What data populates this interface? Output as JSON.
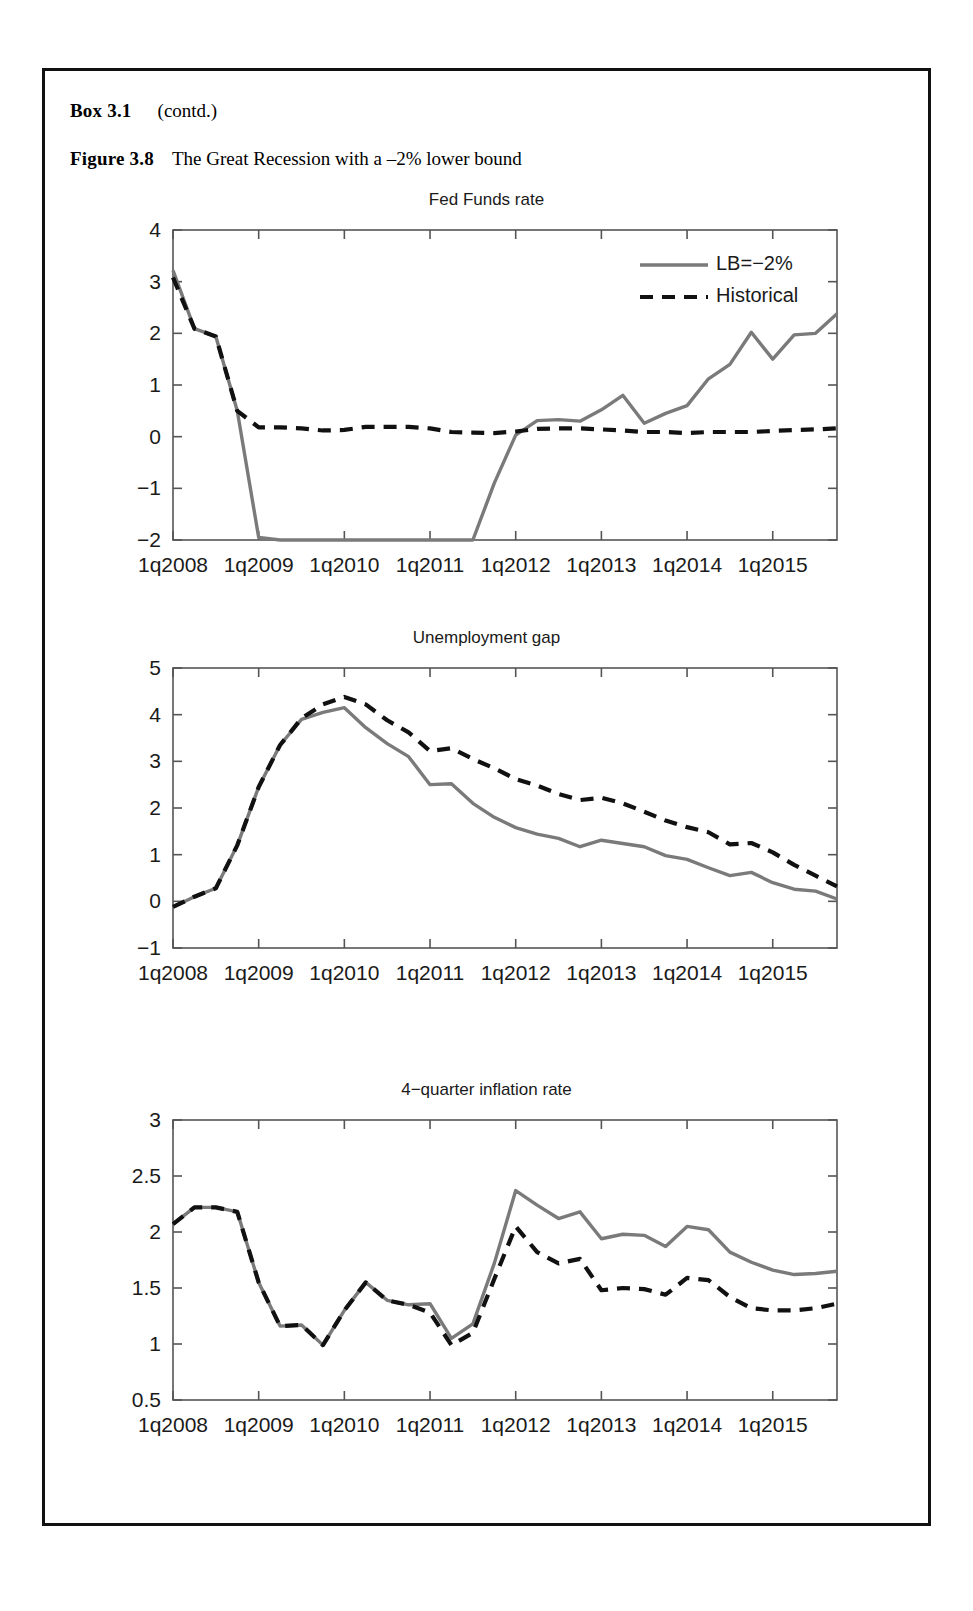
{
  "box": {
    "label": "Box 3.1",
    "contd": "(contd.)"
  },
  "figure": {
    "label": "Figure 3.8",
    "caption": "The Great Recession with a –2% lower bound"
  },
  "legend": {
    "series_solid": "LB=−2%",
    "series_dashed": "Historical",
    "position": "top-right-panel-1"
  },
  "colors": {
    "solid_line": "#7a7a7a",
    "dashed_line": "#111111",
    "axis": "#555555",
    "frame": "#111111",
    "text": "#1a1a1a"
  },
  "x_tick_labels": [
    "1q2008",
    "1q2009",
    "1q2010",
    "1q2011",
    "1q2012",
    "1q2013",
    "1q2014",
    "1q2015"
  ],
  "chart_data": [
    {
      "type": "line",
      "title": "Fed Funds rate",
      "xlabel": "",
      "ylabel": "",
      "xlim": [
        2008.0,
        2015.75
      ],
      "ylim": [
        -2,
        4
      ],
      "yticks": [
        -2,
        -1,
        0,
        1,
        2,
        3,
        4
      ],
      "ytick_labels": [
        "−2",
        "−1",
        "0",
        "1",
        "2",
        "3",
        "4"
      ],
      "xticks": [
        2008.0,
        2009.0,
        2010.0,
        2011.0,
        2012.0,
        2013.0,
        2014.0,
        2015.0
      ],
      "xtick_labels": [
        "1q2008",
        "1q2009",
        "1q2010",
        "1q2011",
        "1q2012",
        "1q2013",
        "1q2014",
        "1q2015"
      ],
      "grid": false,
      "legend": [
        "LB=−2%",
        "Historical"
      ],
      "x": [
        2008.0,
        2008.25,
        2008.5,
        2008.75,
        2009.0,
        2009.25,
        2009.5,
        2009.75,
        2010.0,
        2010.25,
        2010.5,
        2010.75,
        2011.0,
        2011.25,
        2011.5,
        2011.75,
        2012.0,
        2012.25,
        2012.5,
        2012.75,
        2013.0,
        2013.25,
        2013.5,
        2013.75,
        2014.0,
        2014.25,
        2014.5,
        2014.75,
        2015.0,
        2015.25,
        2015.5,
        2015.75
      ],
      "series": [
        {
          "name": "LB=−2%",
          "style": "solid",
          "color": "#7a7a7a",
          "values": [
            3.22,
            2.09,
            1.94,
            0.5,
            -1.95,
            -2.0,
            -2.0,
            -2.0,
            -2.0,
            -2.0,
            -2.0,
            -2.0,
            -2.0,
            -2.0,
            -2.0,
            -0.9,
            0.03,
            0.31,
            0.33,
            0.3,
            0.52,
            0.8,
            0.26,
            0.45,
            0.6,
            1.12,
            1.4,
            2.02,
            1.5,
            1.97,
            2.0,
            2.38
          ]
        },
        {
          "name": "Historical",
          "style": "dashed",
          "color": "#111111",
          "values": [
            3.08,
            2.09,
            1.94,
            0.5,
            0.18,
            0.18,
            0.16,
            0.12,
            0.13,
            0.19,
            0.19,
            0.19,
            0.16,
            0.09,
            0.08,
            0.07,
            0.1,
            0.15,
            0.16,
            0.16,
            0.14,
            0.12,
            0.09,
            0.09,
            0.07,
            0.09,
            0.09,
            0.09,
            0.11,
            0.13,
            0.14,
            0.16
          ]
        }
      ]
    },
    {
      "type": "line",
      "title": "Unemployment gap",
      "xlabel": "",
      "ylabel": "",
      "xlim": [
        2008.0,
        2015.75
      ],
      "ylim": [
        -1,
        5
      ],
      "yticks": [
        -1,
        0,
        1,
        2,
        3,
        4,
        5
      ],
      "ytick_labels": [
        "−1",
        "0",
        "1",
        "2",
        "3",
        "4",
        "5"
      ],
      "xticks": [
        2008.0,
        2009.0,
        2010.0,
        2011.0,
        2012.0,
        2013.0,
        2014.0,
        2015.0
      ],
      "xtick_labels": [
        "1q2008",
        "1q2009",
        "1q2010",
        "1q2011",
        "1q2012",
        "1q2013",
        "1q2014",
        "1q2015"
      ],
      "grid": false,
      "legend": [
        "LB=−2%",
        "Historical"
      ],
      "x": [
        2008.0,
        2008.25,
        2008.5,
        2008.75,
        2009.0,
        2009.25,
        2009.5,
        2009.75,
        2010.0,
        2010.25,
        2010.5,
        2010.75,
        2011.0,
        2011.25,
        2011.5,
        2011.75,
        2012.0,
        2012.25,
        2012.5,
        2012.75,
        2013.0,
        2013.25,
        2013.5,
        2013.75,
        2014.0,
        2014.25,
        2014.5,
        2014.75,
        2015.0,
        2015.25,
        2015.5,
        2015.75
      ],
      "series": [
        {
          "name": "LB=−2%",
          "style": "solid",
          "color": "#7a7a7a",
          "values": [
            -0.12,
            0.1,
            0.28,
            1.2,
            2.45,
            3.35,
            3.9,
            4.05,
            4.15,
            3.72,
            3.38,
            3.1,
            2.5,
            2.52,
            2.1,
            1.8,
            1.58,
            1.44,
            1.35,
            1.17,
            1.31,
            1.24,
            1.17,
            0.98,
            0.9,
            0.72,
            0.55,
            0.62,
            0.4,
            0.26,
            0.22,
            0.05
          ]
        },
        {
          "name": "Historical",
          "style": "dashed",
          "color": "#111111",
          "values": [
            -0.12,
            0.1,
            0.28,
            1.2,
            2.45,
            3.35,
            3.92,
            4.22,
            4.38,
            4.22,
            3.88,
            3.62,
            3.22,
            3.28,
            3.05,
            2.85,
            2.62,
            2.48,
            2.3,
            2.17,
            2.22,
            2.1,
            1.92,
            1.73,
            1.59,
            1.48,
            1.22,
            1.25,
            1.05,
            0.78,
            0.55,
            0.32
          ]
        }
      ]
    },
    {
      "type": "line",
      "title": "4−quarter inflation rate",
      "xlabel": "",
      "ylabel": "",
      "xlim": [
        2008.0,
        2015.75
      ],
      "ylim": [
        0.5,
        3
      ],
      "yticks": [
        0.5,
        1,
        1.5,
        2,
        2.5,
        3
      ],
      "ytick_labels": [
        "0.5",
        "1",
        "1.5",
        "2",
        "2.5",
        "3"
      ],
      "xticks": [
        2008.0,
        2009.0,
        2010.0,
        2011.0,
        2012.0,
        2013.0,
        2014.0,
        2015.0
      ],
      "xtick_labels": [
        "1q2008",
        "1q2009",
        "1q2010",
        "1q2011",
        "1q2012",
        "1q2013",
        "1q2014",
        "1q2015"
      ],
      "grid": false,
      "legend": [
        "LB=−2%",
        "Historical"
      ],
      "x": [
        2008.0,
        2008.25,
        2008.5,
        2008.75,
        2009.0,
        2009.25,
        2009.5,
        2009.75,
        2010.0,
        2010.25,
        2010.5,
        2010.75,
        2011.0,
        2011.25,
        2011.5,
        2011.75,
        2012.0,
        2012.25,
        2012.5,
        2012.75,
        2013.0,
        2013.25,
        2013.5,
        2013.75,
        2014.0,
        2014.25,
        2014.5,
        2014.75,
        2015.0,
        2015.25,
        2015.5,
        2015.75
      ],
      "series": [
        {
          "name": "LB=−2%",
          "style": "solid",
          "color": "#7a7a7a",
          "values": [
            2.07,
            2.22,
            2.22,
            2.18,
            1.55,
            1.16,
            1.17,
            0.99,
            1.3,
            1.55,
            1.39,
            1.35,
            1.36,
            1.05,
            1.18,
            1.72,
            2.37,
            2.24,
            2.12,
            2.18,
            1.94,
            1.98,
            1.97,
            1.87,
            2.05,
            2.02,
            1.82,
            1.73,
            1.66,
            1.62,
            1.63,
            1.65
          ]
        },
        {
          "name": "Historical",
          "style": "dashed",
          "color": "#111111",
          "values": [
            2.07,
            2.22,
            2.22,
            2.18,
            1.55,
            1.16,
            1.17,
            0.99,
            1.3,
            1.55,
            1.39,
            1.35,
            1.28,
            0.99,
            1.1,
            1.58,
            2.05,
            1.82,
            1.72,
            1.76,
            1.48,
            1.5,
            1.49,
            1.44,
            1.59,
            1.57,
            1.42,
            1.32,
            1.3,
            1.3,
            1.32,
            1.36
          ]
        }
      ]
    }
  ]
}
